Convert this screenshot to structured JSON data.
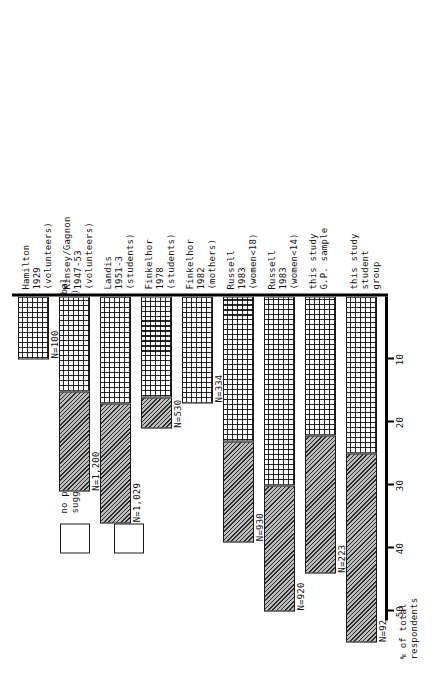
{
  "chart_data": {
    "type": "bar",
    "orientation": "vertical-stacked",
    "title": "",
    "xlabel": "",
    "ylabel": "% of total respondents",
    "ylim": [
      0,
      55
    ],
    "yticks": [
      10,
      20,
      30,
      40,
      50
    ],
    "grid": false,
    "legend_position": "upper-left",
    "categories": [
      {
        "line1": "Hamilton",
        "line2": "1929",
        "line3": "(volunteers)"
      },
      {
        "line1": "Kinsey/Gagnon",
        "line2": "1947-53",
        "line3": "(volunteers)"
      },
      {
        "line1": "Landis",
        "line2": "1951-3",
        "line3": "(students)"
      },
      {
        "line1": "Finkelhor",
        "line2": "1978",
        "line3": "(students)"
      },
      {
        "line1": "Finkelhor",
        "line2": "1982",
        "line3": "(mothers)"
      },
      {
        "line1": "Russell",
        "line2": "1983",
        "line3": "(women<18)"
      },
      {
        "line1": "Russell",
        "line2": "1983",
        "line3": "(women<14)"
      },
      {
        "line1": "this study",
        "line2": "G.P. sample",
        "line3": ""
      },
      {
        "line1": "this study",
        "line2": "student",
        "line3": "group"
      }
    ],
    "n_labels": [
      "N=100",
      "N=1,200",
      "N=1,029",
      "N=530",
      "N=334",
      "N=930",
      "N=920",
      "N=223",
      "N=92"
    ],
    "series": [
      {
        "name": "physical contact",
        "pattern": "grid",
        "values": [
          10,
          15,
          17,
          16,
          17,
          23,
          30,
          22,
          25
        ]
      },
      {
        "name": "no physical contact (exhibitionism, verbal suggestions and obscene telephone calls)",
        "pattern": "hatch",
        "values": [
          0,
          16,
          19,
          5,
          0,
          16,
          20,
          22,
          30
        ]
      }
    ],
    "totals": [
      10,
      31,
      36,
      21,
      17,
      39,
      50,
      44,
      55
    ]
  },
  "axis": {
    "title_line1": "% of total",
    "title_line2": "respondents",
    "tick_labels": [
      "50",
      "40",
      "30",
      "20",
      "10"
    ]
  },
  "legend": {
    "items": [
      {
        "pattern": "hatch",
        "line1": "no physical contact (exhibitionism, verbal",
        "line2": "suggestions and obscene telephone calls)"
      },
      {
        "pattern": "grid",
        "line1": "physical contact",
        "line2": ""
      }
    ]
  },
  "colors": {
    "ink": "#111111",
    "hatch_fill": "#bdbdbd",
    "grid_fill": "#ffffff",
    "background": "#ffffff"
  }
}
